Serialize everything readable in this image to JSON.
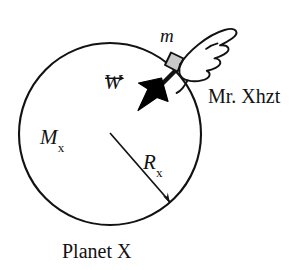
{
  "figure": {
    "caption": "Planet X",
    "labels": {
      "mass_block": "m",
      "weight_vector_symbol": "W",
      "weight_vector_full": "W⃗",
      "planet_mass_symbol": "M",
      "planet_mass_subscript": "x",
      "planet_radius_symbol": "R",
      "planet_radius_subscript": "x",
      "person": "Mr. Xhzt"
    },
    "colors": {
      "stroke": "#121212",
      "background": "#ffffff",
      "block_fill": "#c9c9c9",
      "arrow_fill": "#000000"
    },
    "geometry": {
      "planet_center_x": 110,
      "planet_center_y": 134,
      "planet_radius": 91,
      "block_x": 172,
      "block_y": 63,
      "weight_arrow_tip_x": 139,
      "weight_arrow_tip_y": 106,
      "radius_arrow_tip_x": 172,
      "radius_arrow_tip_y": 205
    },
    "icons": {
      "hand": "pointing-hand-icon",
      "weight_arrow": "down-left-arrow-icon",
      "radius_arrow": "radius-arrow-icon"
    }
  }
}
